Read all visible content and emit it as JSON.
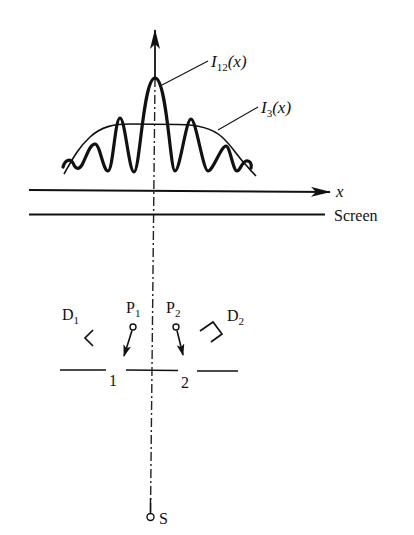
{
  "diagram": {
    "labels": {
      "I12_main": "I",
      "I12_sub": "12",
      "I12_arg": "(x)",
      "I3_main": "I",
      "I3_sub": "3",
      "I3_arg": "(x)",
      "x_axis": "x",
      "screen": "Screen",
      "D1_main": "D",
      "D1_sub": "1",
      "D2_main": "D",
      "D2_sub": "2",
      "P1_main": "P",
      "P1_sub": "1",
      "P2_main": "P",
      "P2_sub": "2",
      "slit1": "1",
      "slit2": "2",
      "source": "S"
    },
    "components": [
      {
        "id": "source",
        "label": "S",
        "type": "point source"
      },
      {
        "id": "slit-1",
        "label": "1",
        "type": "slit"
      },
      {
        "id": "slit-2",
        "label": "2",
        "type": "slit"
      },
      {
        "id": "polarizer-1",
        "label": "P1",
        "type": "probe"
      },
      {
        "id": "polarizer-2",
        "label": "P2",
        "type": "probe"
      },
      {
        "id": "detector-1",
        "label": "D1",
        "type": "detector"
      },
      {
        "id": "detector-2",
        "label": "D2",
        "type": "detector"
      },
      {
        "id": "screen",
        "label": "Screen",
        "type": "screen"
      }
    ],
    "curves": [
      {
        "name": "I12(x)",
        "description": "interference pattern, sharp central peak with side fringes"
      },
      {
        "name": "I3(x)",
        "description": "smooth broad envelope without fringes"
      }
    ],
    "colors": {
      "ink": "#111111",
      "background": "#ffffff"
    }
  }
}
